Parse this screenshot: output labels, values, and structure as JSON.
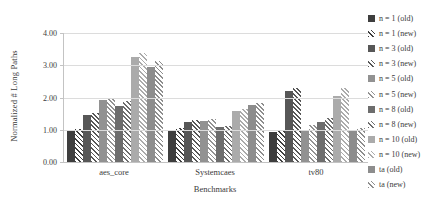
{
  "chart_data": {
    "type": "bar",
    "title": "",
    "xlabel": "Benchmarks",
    "ylabel": "Normalized # Long Paths",
    "ylim": [
      0,
      4
    ],
    "ytick_labels": [
      "4.00",
      "3.00",
      "2.00",
      "1.00",
      "0.00"
    ],
    "grid": true,
    "legend_position": "right",
    "categories": [
      "aes_core",
      "Systemcaes",
      "tv80"
    ],
    "series": [
      {
        "name": "n = 1 (old)",
        "pattern": "solid",
        "color": "#3e3e3e",
        "values": [
          0.98,
          1.0,
          0.93
        ]
      },
      {
        "name": "n = 1 (new)",
        "pattern": "hatch",
        "color": "#3e3e3e",
        "values": [
          1.02,
          1.05,
          1.0
        ]
      },
      {
        "name": "n = 3 (old)",
        "pattern": "solid",
        "color": "#575757",
        "values": [
          1.45,
          1.25,
          2.2
        ]
      },
      {
        "name": "n = 3 (new)",
        "pattern": "hatch",
        "color": "#575757",
        "values": [
          1.52,
          1.31,
          2.3
        ]
      },
      {
        "name": "n = 5 (old)",
        "pattern": "solid",
        "color": "#929292",
        "values": [
          1.93,
          1.26,
          0.97
        ]
      },
      {
        "name": "n = 5 (new)",
        "pattern": "hatch",
        "color": "#929292",
        "values": [
          2.0,
          1.33,
          1.15
        ]
      },
      {
        "name": "n = 8 (old)",
        "pattern": "solid",
        "color": "#6d6d6d",
        "values": [
          1.75,
          1.08,
          1.25
        ]
      },
      {
        "name": "n = 8 (new)",
        "pattern": "hatch",
        "color": "#6d6d6d",
        "values": [
          1.9,
          1.13,
          1.37
        ]
      },
      {
        "name": "n = 10 (old)",
        "pattern": "solid",
        "color": "#ababab",
        "values": [
          3.25,
          1.58,
          2.05
        ]
      },
      {
        "name": "n = 10 (new)",
        "pattern": "hatch",
        "color": "#ababab",
        "values": [
          3.37,
          1.65,
          2.3
        ]
      },
      {
        "name": "ta (old)",
        "pattern": "solid",
        "color": "#8d8d8d",
        "values": [
          2.95,
          1.78,
          0.97
        ]
      },
      {
        "name": "ta (new)",
        "pattern": "hatch",
        "color": "#8d8d8d",
        "values": [
          3.13,
          1.84,
          1.05
        ]
      }
    ]
  },
  "colors": {
    "gridline": "#dcdcdc",
    "axis_line": "#c3c3c3",
    "text": "#3b3b3b",
    "background": "#ffffff",
    "hatch_background": "#ffffff"
  }
}
